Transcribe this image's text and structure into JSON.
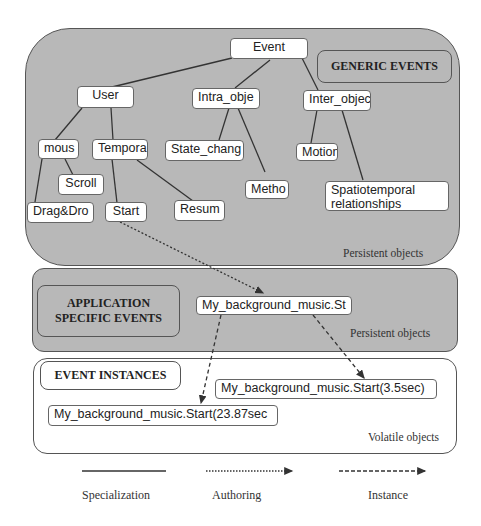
{
  "panels": {
    "generic": {
      "title": "GENERIC EVENTS",
      "note": "Persistent objects"
    },
    "application": {
      "title_line1": "APPLICATION",
      "title_line2": "SPECIFIC EVENTS",
      "note": "Persistent objects"
    },
    "instances": {
      "title": "EVENT INSTANCES",
      "note": "Volatile objects"
    }
  },
  "nodes": {
    "event": "Event",
    "user": "User",
    "intra": "Intra_obje",
    "inter": "Inter_objec",
    "mous": "mous",
    "tempora": "Tempora",
    "state_chang": "State_chang",
    "motion": "Motion",
    "scroll": "Scroll",
    "metho": "Metho",
    "spatio_line1": "Spatiotemporal",
    "spatio_line2": "relationships",
    "dragdro": "Drag&Dro",
    "start": "Start",
    "resum": "Resum",
    "bg_music": "My_background_music.St",
    "instance1": "My_background_music.Start(3.5sec)",
    "instance2": "My_background_music.Start(23.87sec"
  },
  "legend": [
    {
      "label": "Specialization",
      "style": "solid"
    },
    {
      "label": "Authoring",
      "style": "dotted-arrow"
    },
    {
      "label": "Instance",
      "style": "dashed-arrow"
    }
  ]
}
